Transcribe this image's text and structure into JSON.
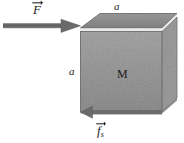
{
  "figure": {
    "background_color": "#ffffff",
    "width": 184,
    "height": 143
  },
  "labels": {
    "applied_force": "F",
    "friction_force": "f",
    "friction_subscript": "s",
    "dimension_top": "a",
    "dimension_left": "a",
    "mass": "M"
  },
  "colors": {
    "block_front": "#9a9a9a",
    "block_top": "#8d8d8d",
    "block_highlight": "#e8e8e8",
    "block_edge": "#6f6f6f",
    "arrow": "#606060",
    "text": "#1c1c1c"
  },
  "geometry": {
    "block_front_rect": {
      "x": 80,
      "y": 27,
      "width": 82,
      "height": 84
    },
    "block_top_face": "parallelogram from (80,27) to (100,13) to (177,13) to (162,27)",
    "force_arrow": {
      "from_x": 3,
      "from_y": 26,
      "to_x": 80,
      "to_y": 26,
      "direction": "right"
    },
    "friction_arrow": {
      "from_x": 162,
      "from_y": 113,
      "to_x": 84,
      "to_y": 113,
      "direction": "left"
    }
  },
  "vectors": [
    {
      "name": "applied-force",
      "symbol": "F",
      "direction": "right",
      "description": "applied horizontal force pushing block"
    },
    {
      "name": "static-friction",
      "symbol": "f_s",
      "direction": "left",
      "description": "static friction force opposing motion"
    }
  ]
}
